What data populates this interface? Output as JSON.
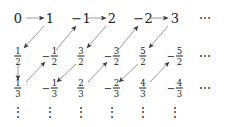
{
  "figure": {
    "width": 234,
    "height": 127,
    "background_color": "#ffffff",
    "text_color": "#1a1a1a",
    "arrow_color": "#9a9a9a",
    "arrowhead_color": "#3a3a3a"
  },
  "grid": {
    "columns_x": [
      18,
      50,
      81,
      112,
      143,
      175
    ],
    "rows_y": [
      18,
      56,
      88
    ],
    "row_ellipsis_x": 205,
    "column_ellipsis_y": 112
  },
  "cells": [
    {
      "row": 0,
      "col": 0,
      "kind": "integer",
      "sign": "",
      "value": "0",
      "numerator": "0",
      "denominator": "1"
    },
    {
      "row": 0,
      "col": 1,
      "kind": "integer",
      "sign": "",
      "value": "1",
      "numerator": "1",
      "denominator": "1"
    },
    {
      "row": 0,
      "col": 2,
      "kind": "integer",
      "sign": "−",
      "value": "1",
      "numerator": "-1",
      "denominator": "1"
    },
    {
      "row": 0,
      "col": 3,
      "kind": "integer",
      "sign": "",
      "value": "2",
      "numerator": "2",
      "denominator": "1"
    },
    {
      "row": 0,
      "col": 4,
      "kind": "integer",
      "sign": "−",
      "value": "2",
      "numerator": "-2",
      "denominator": "1"
    },
    {
      "row": 0,
      "col": 5,
      "kind": "integer",
      "sign": "",
      "value": "3",
      "numerator": "3",
      "denominator": "1"
    },
    {
      "row": 1,
      "col": 0,
      "kind": "fraction",
      "sign": "",
      "numerator": "1",
      "denominator": "2"
    },
    {
      "row": 1,
      "col": 1,
      "kind": "fraction",
      "sign": "−",
      "numerator": "1",
      "denominator": "2"
    },
    {
      "row": 1,
      "col": 2,
      "kind": "fraction",
      "sign": "",
      "numerator": "3",
      "denominator": "2"
    },
    {
      "row": 1,
      "col": 3,
      "kind": "fraction",
      "sign": "−",
      "numerator": "3",
      "denominator": "2"
    },
    {
      "row": 1,
      "col": 4,
      "kind": "fraction",
      "sign": "",
      "numerator": "5",
      "denominator": "2"
    },
    {
      "row": 1,
      "col": 5,
      "kind": "fraction",
      "sign": "−",
      "numerator": "5",
      "denominator": "2"
    },
    {
      "row": 2,
      "col": 0,
      "kind": "fraction",
      "sign": "",
      "numerator": "1",
      "denominator": "3"
    },
    {
      "row": 2,
      "col": 1,
      "kind": "fraction",
      "sign": "−",
      "numerator": "1",
      "denominator": "3"
    },
    {
      "row": 2,
      "col": 2,
      "kind": "fraction",
      "sign": "",
      "numerator": "2",
      "denominator": "3"
    },
    {
      "row": 2,
      "col": 3,
      "kind": "fraction",
      "sign": "−",
      "numerator": "2",
      "denominator": "3"
    },
    {
      "row": 2,
      "col": 4,
      "kind": "fraction",
      "sign": "",
      "numerator": "4",
      "denominator": "3"
    },
    {
      "row": 2,
      "col": 5,
      "kind": "fraction",
      "sign": "−",
      "numerator": "4",
      "denominator": "3"
    }
  ],
  "row_ellipses": [
    {
      "row": 0,
      "glyph": "⋯"
    },
    {
      "row": 1,
      "glyph": "⋯"
    },
    {
      "row": 2,
      "glyph": "⋯"
    }
  ],
  "column_ellipses": [
    {
      "col": 0,
      "glyph": "⋮"
    },
    {
      "col": 1,
      "glyph": "⋮"
    },
    {
      "col": 2,
      "glyph": "⋮"
    },
    {
      "col": 3,
      "glyph": "⋮"
    },
    {
      "col": 4,
      "glyph": "⋮"
    },
    {
      "col": 5,
      "glyph": "⋮"
    }
  ],
  "arrows": [
    {
      "type": "horizontal",
      "x1": 26,
      "y1": 18,
      "x2": 44,
      "y2": 18
    },
    {
      "type": "diagonal-down",
      "x1": 44,
      "y1": 26,
      "x2": 24,
      "y2": 48
    },
    {
      "type": "vertical",
      "x1": 18,
      "y1": 64,
      "x2": 18,
      "y2": 80
    },
    {
      "type": "diagonal-up",
      "x1": 26,
      "y1": 82,
      "x2": 45,
      "y2": 62
    },
    {
      "type": "diagonal-up",
      "x1": 56,
      "y1": 50,
      "x2": 76,
      "y2": 26
    },
    {
      "type": "horizontal",
      "x1": 88,
      "y1": 18,
      "x2": 106,
      "y2": 18
    },
    {
      "type": "diagonal-down",
      "x1": 106,
      "y1": 26,
      "x2": 87,
      "y2": 48
    },
    {
      "type": "diagonal-down",
      "x1": 76,
      "y1": 64,
      "x2": 57,
      "y2": 82
    },
    {
      "type": "diagonal-up",
      "x1": 88,
      "y1": 82,
      "x2": 107,
      "y2": 62
    },
    {
      "type": "diagonal-up",
      "x1": 118,
      "y1": 50,
      "x2": 138,
      "y2": 26
    },
    {
      "type": "horizontal",
      "x1": 150,
      "y1": 18,
      "x2": 168,
      "y2": 18
    },
    {
      "type": "diagonal-down",
      "x1": 168,
      "y1": 26,
      "x2": 149,
      "y2": 48
    },
    {
      "type": "diagonal-down",
      "x1": 138,
      "y1": 64,
      "x2": 119,
      "y2": 82
    },
    {
      "type": "diagonal-up",
      "x1": 150,
      "y1": 82,
      "x2": 169,
      "y2": 62
    }
  ]
}
